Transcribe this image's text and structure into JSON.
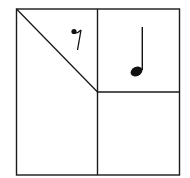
{
  "diagram": {
    "stroke_color": "#1a1a1a",
    "background": "#ffffff",
    "regions": [
      {
        "name": "top-left-triangle",
        "symbol": "eighth-rest",
        "glyph": "𝄾"
      },
      {
        "name": "left-lower-trapezoid",
        "symbol": "none"
      },
      {
        "name": "top-right-square",
        "symbol": "quarter-note",
        "glyph": "♩"
      },
      {
        "name": "bottom-right-square",
        "symbol": "none"
      }
    ]
  }
}
